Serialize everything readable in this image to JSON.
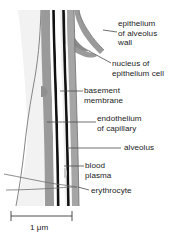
{
  "figure": {
    "width": 186,
    "height": 245,
    "background": "#ffffff"
  },
  "labels": [
    {
      "id": "epithelium-of-alveolus-wall",
      "lines": [
        "epithelium",
        "of alveolus",
        "wall"
      ],
      "line1": "epithelium",
      "line2": "of alveolus",
      "line3": "wall",
      "x": 118,
      "y": 19,
      "leader_from": [
        117,
        34
      ],
      "leader_to": [
        103,
        31
      ]
    },
    {
      "id": "nucleus-of-epithelium-cell",
      "lines": [
        "nucleus of",
        "epithelium cell"
      ],
      "line1": "nucleus of",
      "line2": "epithelium cell",
      "x": 112,
      "y": 59,
      "leader_from": [
        111,
        63
      ],
      "leader_to": [
        88,
        51
      ]
    },
    {
      "id": "basement-membrane",
      "lines": [
        "basement",
        "membrane"
      ],
      "line1": "basement",
      "line2": "membrane",
      "x": 84,
      "y": 86,
      "leader_from": [
        83,
        91
      ],
      "leader_to": [
        62,
        91
      ]
    },
    {
      "id": "endothelium-of-capillary",
      "lines": [
        "endothelium",
        "of capillary"
      ],
      "line1": "endothelium",
      "line2": "of capillary",
      "x": 97,
      "y": 114,
      "leader_from": [
        96,
        122
      ],
      "leader_to": [
        47,
        122
      ]
    },
    {
      "id": "alveolus",
      "lines": [
        "alveolus"
      ],
      "line1": "alveolus",
      "x": 124,
      "y": 143,
      "leader_from": [
        121,
        148
      ],
      "leader_to": [
        67,
        148
      ]
    },
    {
      "id": "blood-plasma",
      "lines": [
        "blood",
        "plasma"
      ],
      "line1": "blood",
      "line2": "plasma",
      "x": 85,
      "y": 161,
      "leader_from": [
        84,
        166
      ],
      "leader_to": [
        64,
        166
      ]
    },
    {
      "id": "erythrocyte",
      "lines": [
        "erythrocyte"
      ],
      "line1": "erythrocyte",
      "x": 91,
      "y": 186,
      "leader_from": [
        89,
        190
      ],
      "leader_to": [
        77,
        187
      ]
    }
  ],
  "scale_bar": {
    "label": "1 μm",
    "value": 1,
    "unit": "μm",
    "x_start": 11,
    "x_end": 72,
    "y": 216,
    "tick_height": 10,
    "label_x": 30,
    "label_y": 225
  },
  "structures": [
    {
      "id": "alveolus-airspace",
      "name": "alveolus",
      "color": "#f2f2f2"
    },
    {
      "id": "epithelium-layer",
      "name": "epithelium of alveolus wall",
      "color": "#9a9a9a"
    },
    {
      "id": "epithelium-nucleus",
      "name": "nucleus of epithelium cell",
      "color": "#8c8c8c"
    },
    {
      "id": "basement-membrane-layer",
      "name": "basement membrane",
      "color": "#111111"
    },
    {
      "id": "endothelium-layer",
      "name": "endothelium of capillary",
      "color": "#a5a5a5"
    },
    {
      "id": "blood-plasma-layer",
      "name": "blood plasma",
      "color": "#e8e8e8"
    },
    {
      "id": "erythrocyte-body",
      "name": "erythrocyte",
      "color": "#efefef"
    }
  ],
  "colors": {
    "ink": "#1a1a1a",
    "leader": "#4d4d4d",
    "outline": "#5a5a5a",
    "membrane": "#111111",
    "mid_gray": "#9a9a9a",
    "light_gray": "#f2f2f2",
    "plasma": "#e4e4e4",
    "white": "#ffffff"
  }
}
